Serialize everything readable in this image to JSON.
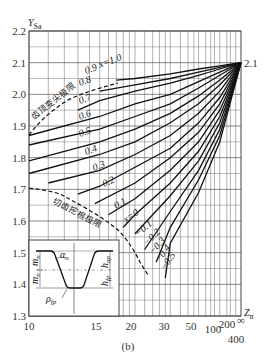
{
  "chart_data": {
    "type": "line",
    "title": "",
    "caption": "(b)",
    "xlabel": "Z_n",
    "ylabel": "Y_Sa",
    "x_scale": "reciprocal",
    "x_ticks": [
      "10",
      "15",
      "20",
      "30",
      "50",
      "100",
      "200",
      "400",
      "∞"
    ],
    "y_ticks": [
      "1.3",
      "1.4",
      "1.5",
      "1.6",
      "1.7",
      "1.8",
      "1.9",
      "2.0",
      "2.1",
      "2.2"
    ],
    "ylim": [
      1.3,
      2.2
    ],
    "xlim": [
      10,
      "∞"
    ],
    "grid": true,
    "convergence_point": {
      "x": "∞",
      "y": 2.1,
      "label": "2.1"
    },
    "series": [
      {
        "name": "x=1.0",
        "x": [
          17,
          20,
          30,
          50,
          100,
          "∞"
        ],
        "y": [
          2.045,
          2.05,
          2.065,
          2.08,
          2.09,
          2.1
        ]
      },
      {
        "name": "0.9",
        "x": [
          15,
          20,
          30,
          50,
          100,
          "∞"
        ],
        "y": [
          2.01,
          2.03,
          2.05,
          2.07,
          2.085,
          2.1
        ]
      },
      {
        "name": "0.8",
        "x": [
          13,
          15,
          20,
          30,
          50,
          100,
          "∞"
        ],
        "y": [
          1.95,
          1.98,
          2.01,
          2.035,
          2.06,
          2.08,
          2.1
        ]
      },
      {
        "name": "0.7",
        "x": [
          10,
          15,
          20,
          30,
          50,
          100,
          "∞"
        ],
        "y": [
          1.87,
          1.93,
          1.97,
          2.0,
          2.04,
          2.07,
          2.1
        ]
      },
      {
        "name": "0.6",
        "x": [
          10,
          15,
          20,
          30,
          50,
          100,
          "∞"
        ],
        "y": [
          1.84,
          1.89,
          1.93,
          1.97,
          2.02,
          2.06,
          2.1
        ]
      },
      {
        "name": "0.5",
        "x": [
          10,
          15,
          20,
          30,
          50,
          100,
          "∞"
        ],
        "y": [
          1.79,
          1.85,
          1.89,
          1.94,
          1.995,
          2.045,
          2.1
        ]
      },
      {
        "name": "0.4",
        "x": [
          10,
          15,
          20,
          30,
          50,
          100,
          "∞"
        ],
        "y": [
          1.75,
          1.81,
          1.85,
          1.91,
          1.97,
          2.03,
          2.1
        ]
      },
      {
        "name": "0.3",
        "x": [
          11,
          15,
          20,
          30,
          50,
          100,
          "∞"
        ],
        "y": [
          1.72,
          1.76,
          1.81,
          1.87,
          1.94,
          2.01,
          2.1
        ]
      },
      {
        "name": "0.2",
        "x": [
          13,
          15,
          20,
          30,
          50,
          100,
          "∞"
        ],
        "y": [
          1.685,
          1.71,
          1.77,
          1.83,
          1.91,
          1.99,
          2.1
        ]
      },
      {
        "name": "0.1",
        "x": [
          14.5,
          20,
          30,
          50,
          100,
          "∞"
        ],
        "y": [
          1.655,
          1.72,
          1.8,
          1.88,
          1.97,
          2.1
        ]
      },
      {
        "name": "x=0",
        "x": [
          16,
          20,
          30,
          50,
          100,
          "∞"
        ],
        "y": [
          1.62,
          1.67,
          1.76,
          1.85,
          1.95,
          2.1
        ]
      },
      {
        "name": "-0.1",
        "x": [
          18,
          20,
          30,
          50,
          100,
          "∞"
        ],
        "y": [
          1.58,
          1.62,
          1.72,
          1.82,
          1.93,
          2.1
        ]
      },
      {
        "name": "-0.2",
        "x": [
          20,
          30,
          50,
          100,
          "∞"
        ],
        "y": [
          1.56,
          1.68,
          1.79,
          1.91,
          2.1
        ]
      },
      {
        "name": "-0.3",
        "x": [
          22,
          30,
          50,
          100,
          "∞"
        ],
        "y": [
          1.51,
          1.63,
          1.76,
          1.89,
          2.1
        ]
      },
      {
        "name": "-0.4",
        "x": [
          25,
          30,
          50,
          100,
          "∞"
        ],
        "y": [
          1.47,
          1.58,
          1.73,
          1.87,
          2.1
        ]
      },
      {
        "name": "-0.5",
        "x": [
          28,
          30,
          50,
          100,
          "∞"
        ],
        "y": [
          1.42,
          1.53,
          1.69,
          1.85,
          2.1
        ]
      }
    ],
    "boundaries": [
      {
        "name": "齿顶变尖极限",
        "meaning": "tooth tip pointing limit",
        "style": "dashed"
      },
      {
        "name": "切齿挖根极限",
        "meaning": "undercut limit",
        "style": "dashed"
      }
    ],
    "inset": {
      "description": "basic rack tooth profile",
      "labels": [
        "α_n",
        "m_n",
        "m_n",
        "h_ap",
        "h_fp",
        "ρ_fp"
      ]
    }
  },
  "labels": {
    "ylabel_main": "Y",
    "ylabel_sub": "Sa",
    "xlabel_main": "Z",
    "xlabel_sub": "n",
    "caption": "(b)",
    "convergence": "2.1",
    "limit_top": "齿顶变尖极限",
    "limit_bottom": "切齿挖根极限",
    "inset_alpha": "α",
    "inset_alpha_sub": "n",
    "inset_m1": "m",
    "inset_m1_sub": "n",
    "inset_m2": "m",
    "inset_m2_sub": "n",
    "inset_hap": "h",
    "inset_hap_sub": "ap",
    "inset_hfp": "h",
    "inset_hfp_sub": "fp",
    "inset_rho": "ρ",
    "inset_rho_sub": "fp"
  },
  "curve_labels": {
    "c10": "x=1.0",
    "c09": "0.9",
    "c08": "0.8",
    "c07": "0.7",
    "c06": "0.6",
    "c05": "0.5",
    "c04": "0.4",
    "c03": "0.3",
    "c02": "0.2",
    "c01": "0.1",
    "c00": "x=0",
    "cm1": "−0.1",
    "cm2": "−0.2",
    "cm3": "−0.3",
    "cm4": "−0.4",
    "cm5": "−0.5"
  },
  "ticks": {
    "y": [
      "2.2",
      "2.1",
      "2.0",
      "1.9",
      "1.8",
      "1.7",
      "1.6",
      "1.5",
      "1.4",
      "1.3"
    ],
    "x": [
      "10",
      "15",
      "20",
      "30",
      "50",
      "100",
      "200",
      "400",
      "∞"
    ]
  }
}
